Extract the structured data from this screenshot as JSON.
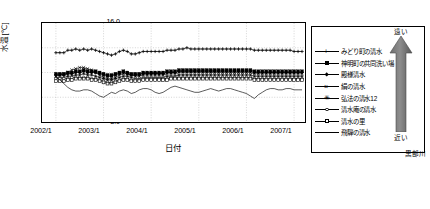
{
  "chart_data": {
    "type": "line",
    "title": "",
    "xlabel": "日付",
    "ylabel": "水温[℃]",
    "ylim": [
      8.0,
      16.0
    ],
    "ytick_labels": [
      "16.0",
      "14.0",
      "12.0",
      "10.0",
      "8.0"
    ],
    "ytick_values": [
      16.0,
      14.0,
      12.0,
      10.0,
      8.0
    ],
    "xtick_labels": [
      "2002/1",
      "2003/1",
      "2004/1",
      "2005/1",
      "2006/1",
      "2007/1"
    ],
    "xlim": [
      "2002/1",
      "2007/6"
    ],
    "grid": "dotted",
    "legend_position": "right-outside",
    "x": [
      "2002/1",
      "2002/2",
      "2002/3",
      "2002/4",
      "2002/5",
      "2002/6",
      "2002/7",
      "2002/8",
      "2002/9",
      "2002/10",
      "2002/11",
      "2002/12",
      "2003/1",
      "2003/2",
      "2003/3",
      "2003/4",
      "2003/5",
      "2003/6",
      "2003/7",
      "2003/8",
      "2003/9",
      "2003/10",
      "2003/11",
      "2003/12",
      "2004/1",
      "2004/2",
      "2004/3",
      "2004/4",
      "2004/5",
      "2004/6",
      "2004/7",
      "2004/8",
      "2004/9",
      "2004/10",
      "2004/11",
      "2004/12",
      "2005/1",
      "2005/2",
      "2005/3",
      "2005/4",
      "2005/5",
      "2005/6",
      "2005/7",
      "2005/8",
      "2005/9",
      "2005/10",
      "2005/11",
      "2005/12",
      "2006/1",
      "2006/2",
      "2006/3",
      "2006/4",
      "2006/5",
      "2006/6",
      "2006/7",
      "2006/8",
      "2006/9",
      "2006/10",
      "2006/11",
      "2006/12",
      "2007/1",
      "2007/2",
      "2007/3"
    ],
    "series": [
      {
        "name": "みどり町の清水",
        "marker": "plus",
        "values": [
          13.6,
          13.6,
          13.6,
          13.8,
          13.8,
          13.9,
          13.8,
          13.9,
          13.8,
          13.9,
          13.8,
          13.7,
          13.6,
          13.5,
          13.4,
          13.5,
          13.7,
          13.8,
          13.7,
          13.5,
          13.5,
          13.6,
          13.7,
          13.7,
          13.7,
          13.7,
          13.7,
          13.7,
          13.8,
          13.8,
          13.8,
          13.9,
          13.9,
          14.0,
          13.9,
          13.9,
          13.9,
          13.9,
          13.9,
          13.9,
          13.9,
          13.9,
          13.9,
          13.9,
          13.9,
          13.9,
          13.9,
          13.9,
          13.9,
          13.9,
          13.8,
          13.8,
          13.8,
          13.8,
          13.8,
          13.8,
          13.8,
          13.8,
          13.8,
          13.8,
          13.7,
          13.7,
          13.7
        ]
      },
      {
        "name": "神明町の共同洗い場",
        "marker": "filled-square",
        "values": [
          11.9,
          11.9,
          11.9,
          12.0,
          12.0,
          12.1,
          12.1,
          12.2,
          12.1,
          12.1,
          12.1,
          12.0,
          11.9,
          11.8,
          11.8,
          11.9,
          12.0,
          12.1,
          12.0,
          11.9,
          11.9,
          11.9,
          12.0,
          12.0,
          12.0,
          12.0,
          12.0,
          12.0,
          12.1,
          12.1,
          12.1,
          12.2,
          12.2,
          12.2,
          12.2,
          12.2,
          12.2,
          12.2,
          12.2,
          12.2,
          12.2,
          12.2,
          12.2,
          12.2,
          12.2,
          12.2,
          12.2,
          12.2,
          12.2,
          12.2,
          12.1,
          12.1,
          12.1,
          12.1,
          12.1,
          12.1,
          12.1,
          12.1,
          12.1,
          12.1,
          12.1,
          12.1,
          12.1
        ]
      },
      {
        "name": "殿様清水",
        "marker": "diamond",
        "values": [
          11.8,
          11.8,
          11.8,
          11.9,
          11.9,
          12.0,
          12.0,
          12.1,
          12.0,
          12.0,
          12.0,
          11.9,
          11.8,
          11.7,
          11.7,
          11.8,
          11.9,
          12.0,
          11.9,
          11.8,
          11.8,
          11.8,
          11.9,
          11.9,
          11.9,
          11.9,
          11.9,
          11.9,
          12.0,
          12.0,
          12.0,
          12.1,
          12.1,
          12.1,
          12.1,
          12.1,
          12.1,
          12.1,
          12.1,
          12.1,
          12.1,
          12.1,
          12.1,
          12.1,
          12.1,
          12.1,
          12.1,
          12.1,
          12.1,
          12.1,
          12.0,
          12.0,
          12.0,
          12.0,
          12.0,
          12.0,
          12.0,
          12.0,
          12.0,
          12.0,
          12.0,
          12.0,
          12.0
        ]
      },
      {
        "name": "絹の清水",
        "marker": "cross",
        "values": [
          11.7,
          11.8,
          11.9,
          12.0,
          12.2,
          12.3,
          12.4,
          12.4,
          12.3,
          12.2,
          12.0,
          11.8,
          11.6,
          11.5,
          11.5,
          11.6,
          11.8,
          11.9,
          11.9,
          11.8,
          11.7,
          11.7,
          11.8,
          11.8,
          11.8,
          11.8,
          11.8,
          11.8,
          11.9,
          11.9,
          11.9,
          12.0,
          12.0,
          12.0,
          12.0,
          12.0,
          12.0,
          12.0,
          12.0,
          12.0,
          12.0,
          12.0,
          12.0,
          12.0,
          12.0,
          12.0,
          12.0,
          12.0,
          12.0,
          12.0,
          11.9,
          11.9,
          11.9,
          11.9,
          11.9,
          11.9,
          11.9,
          11.9,
          11.9,
          11.9,
          11.9,
          11.9,
          11.9
        ]
      },
      {
        "name": "弘法の清水12",
        "marker": "star",
        "values": [
          11.6,
          11.6,
          11.6,
          11.7,
          11.7,
          11.8,
          11.8,
          11.9,
          11.8,
          11.8,
          11.7,
          11.6,
          11.5,
          11.4,
          11.4,
          11.5,
          11.6,
          11.7,
          11.7,
          11.6,
          11.5,
          11.5,
          11.6,
          11.6,
          11.6,
          11.6,
          11.6,
          11.6,
          11.7,
          11.7,
          11.7,
          11.8,
          11.8,
          11.8,
          11.8,
          11.8,
          11.8,
          11.8,
          11.8,
          11.8,
          11.8,
          11.8,
          11.8,
          11.8,
          11.8,
          11.8,
          11.8,
          11.8,
          11.8,
          11.8,
          11.7,
          11.7,
          11.7,
          11.7,
          11.7,
          11.7,
          11.7,
          11.7,
          11.7,
          11.7,
          11.7,
          11.7,
          11.7
        ]
      },
      {
        "name": "清水庵の清水",
        "marker": "open-circle",
        "values": [
          11.5,
          11.5,
          11.5,
          11.5,
          11.6,
          11.6,
          11.6,
          11.6,
          11.6,
          11.5,
          11.5,
          11.4,
          11.3,
          11.2,
          11.2,
          11.3,
          11.4,
          11.5,
          11.5,
          11.4,
          11.4,
          11.4,
          11.5,
          11.5,
          11.5,
          11.5,
          11.5,
          11.5,
          11.5,
          11.6,
          11.6,
          11.6,
          11.6,
          11.6,
          11.6,
          11.6,
          11.6,
          11.6,
          11.6,
          11.6,
          11.6,
          11.6,
          11.6,
          11.6,
          11.6,
          11.6,
          11.6,
          11.6,
          11.6,
          11.6,
          11.5,
          11.5,
          11.5,
          11.5,
          11.5,
          11.5,
          11.5,
          11.5,
          11.5,
          11.5,
          11.5,
          11.5,
          11.5
        ]
      },
      {
        "name": "清水の里",
        "marker": "open-square",
        "values": [
          11.3,
          11.3,
          11.3,
          11.4,
          11.4,
          11.5,
          11.5,
          11.5,
          11.5,
          11.4,
          11.4,
          11.3,
          11.2,
          11.1,
          11.1,
          11.2,
          11.3,
          11.4,
          11.4,
          11.3,
          11.3,
          11.3,
          11.4,
          11.4,
          11.4,
          11.4,
          11.4,
          11.4,
          11.4,
          11.5,
          11.5,
          11.5,
          11.5,
          11.5,
          11.5,
          11.5,
          11.5,
          11.5,
          11.5,
          11.5,
          11.5,
          11.5,
          11.5,
          11.5,
          11.5,
          11.5,
          11.5,
          11.5,
          11.5,
          11.5,
          11.4,
          11.4,
          11.4,
          11.4,
          11.4,
          11.4,
          11.4,
          11.4,
          11.4,
          11.4,
          11.4,
          11.4,
          11.4
        ]
      },
      {
        "name": "飛騨の清水",
        "marker": "none",
        "values": [
          11.6,
          11.4,
          11.1,
          10.8,
          10.6,
          10.5,
          10.5,
          10.6,
          10.6,
          10.5,
          10.3,
          10.1,
          10.0,
          10.2,
          10.4,
          10.3,
          10.5,
          10.6,
          10.5,
          10.3,
          10.4,
          10.6,
          10.7,
          10.7,
          10.6,
          10.4,
          10.3,
          10.4,
          10.6,
          10.8,
          10.9,
          10.8,
          10.7,
          10.6,
          10.5,
          10.4,
          10.4,
          10.5,
          10.6,
          10.7,
          10.6,
          10.5,
          10.6,
          10.7,
          10.7,
          10.6,
          10.5,
          10.4,
          10.3,
          10.1,
          9.9,
          10.2,
          10.4,
          10.6,
          10.7,
          10.7,
          10.6,
          10.6,
          10.7,
          10.7,
          10.6,
          10.6,
          10.6
        ]
      }
    ],
    "annotations": {
      "arrow_top_label": "遠い",
      "arrow_bottom_label": "近い",
      "river_label": "黒部川"
    }
  }
}
